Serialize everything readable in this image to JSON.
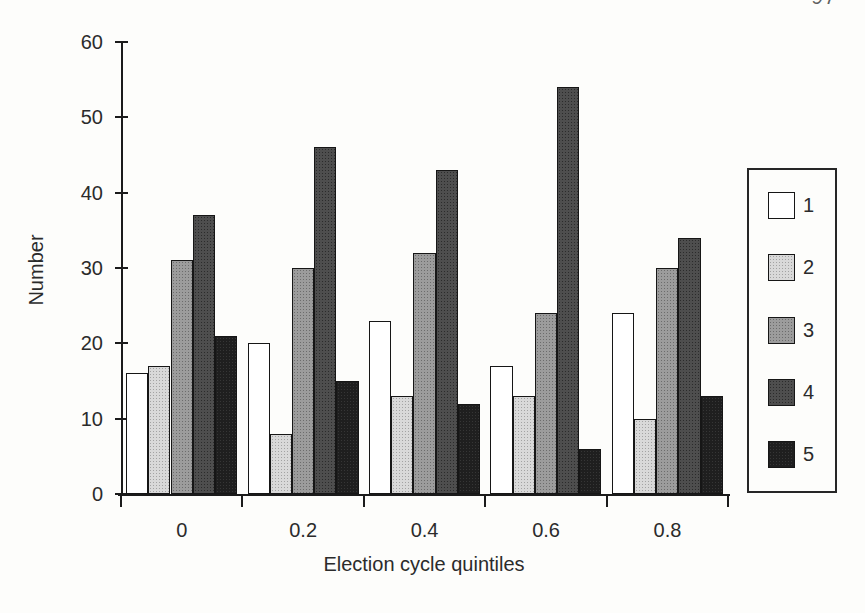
{
  "page": {
    "page_number": "97"
  },
  "chart_data": {
    "type": "bar",
    "title": "",
    "xlabel": "Election cycle quintiles",
    "ylabel": "Number",
    "categories": [
      "0",
      "0.2",
      "0.4",
      "0.6",
      "0.8"
    ],
    "series": [
      {
        "name": "1",
        "color": "#ffffff",
        "values": [
          16,
          20,
          23,
          17,
          24
        ]
      },
      {
        "name": "2",
        "color": "#d9d9d9",
        "values": [
          17,
          8,
          13,
          13,
          10
        ]
      },
      {
        "name": "3",
        "color": "#9c9c9c",
        "values": [
          31,
          30,
          32,
          24,
          30
        ]
      },
      {
        "name": "4",
        "color": "#4e4e4e",
        "values": [
          37,
          46,
          43,
          54,
          34
        ]
      },
      {
        "name": "5",
        "color": "#1f1f1f",
        "values": [
          21,
          15,
          12,
          6,
          13
        ]
      }
    ],
    "ylim": [
      0,
      60
    ],
    "yticks": [
      0,
      10,
      20,
      30,
      40,
      50,
      60
    ],
    "grid": false,
    "legend_position": "right",
    "legend_labels": [
      "1",
      "2",
      "3",
      "4",
      "5"
    ],
    "axis_color": "#1b1b1b",
    "background_color": "#fdfdfb"
  }
}
